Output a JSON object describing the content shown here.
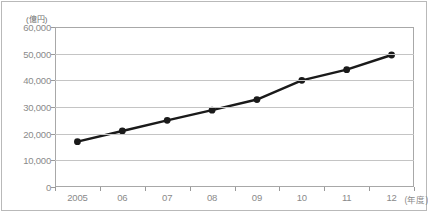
{
  "chart_data": {
    "type": "line",
    "title": "",
    "xlabel": "(年度)",
    "ylabel": "(億円)",
    "unit_label": "(億円)",
    "x_unit_label": "(年度)",
    "categories": [
      "2005",
      "06",
      "07",
      "08",
      "09",
      "10",
      "11",
      "12"
    ],
    "values": [
      17000,
      21000,
      25000,
      28800,
      32800,
      40000,
      44000,
      49500
    ],
    "y_tick_labels": [
      "60,000",
      "50,000",
      "40,000",
      "30,000",
      "20,000",
      "10,000",
      "0"
    ],
    "y_tick_values": [
      60000,
      50000,
      40000,
      30000,
      20000,
      10000,
      0
    ],
    "ylim": [
      0,
      60000
    ],
    "grid": true,
    "legend": "none",
    "series": [
      {
        "name": "",
        "values": [
          17000,
          21000,
          25000,
          28800,
          32800,
          40000,
          44000,
          49500
        ],
        "color": "#1a1a1a",
        "marker": "circle"
      }
    ]
  },
  "style": {
    "line_color": "#1a1a1a",
    "marker_color": "#1a1a1a",
    "grid_color": "#c4c4c4",
    "axis_color": "#a8a8a8",
    "tick_text_color": "#8a8a8a",
    "background": "#ffffff"
  }
}
